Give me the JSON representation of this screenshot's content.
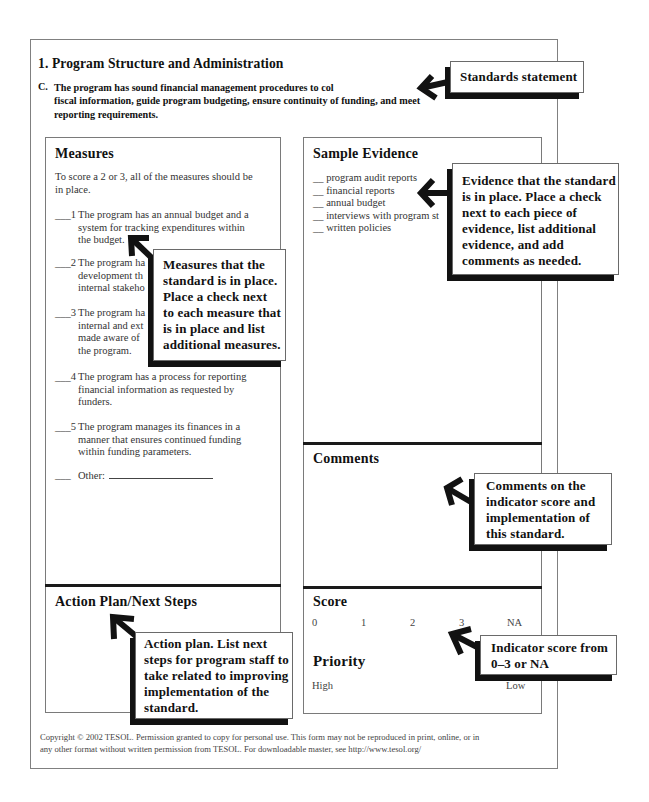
{
  "page": {
    "section_title": "1. Program Structure and Administration",
    "standard": {
      "letter": "C.",
      "lines": [
        "The program has sound financial management procedures to col",
        "fiscal information, guide program budgeting, ensure continuity of funding, and meet",
        "reporting requirements."
      ]
    }
  },
  "measures": {
    "heading": "Measures",
    "intro_lines": [
      "To score a 2 or 3, all of the measures should be",
      "in place."
    ],
    "items": [
      {
        "blank": "___",
        "number": "1",
        "lines": [
          "The program has an annual budget and a",
          "system for tracking expenditures within",
          "the budget."
        ]
      },
      {
        "blank": "___",
        "number": "2",
        "lines": [
          "The program ha",
          "development th",
          "internal stakeho"
        ]
      },
      {
        "blank": "___",
        "number": "3",
        "lines": [
          "The program ha",
          "internal and ext",
          "made aware of",
          "the program."
        ]
      },
      {
        "blank": "___",
        "number": "4",
        "lines": [
          "The program has a process for reporting",
          "financial information as requested by",
          "funders."
        ]
      },
      {
        "blank": "___",
        "number": "5",
        "lines": [
          "The program manages its finances in a",
          "manner that ensures continued funding",
          "within funding parameters."
        ]
      }
    ],
    "other": {
      "blank": "___",
      "label": "Other:"
    }
  },
  "evidence": {
    "heading": "Sample Evidence",
    "items": [
      {
        "blank": "__",
        "label": "program audit reports"
      },
      {
        "blank": "__",
        "label": "financial reports"
      },
      {
        "blank": "__",
        "label": "annual budget"
      },
      {
        "blank": "__",
        "label": "interviews with program st"
      },
      {
        "blank": "__",
        "label": "written policies"
      }
    ]
  },
  "comments": {
    "heading": "Comments"
  },
  "action_plan": {
    "heading": "Action Plan/Next Steps"
  },
  "score": {
    "heading": "Score",
    "options": [
      "0",
      "1",
      "2",
      "3",
      "NA"
    ]
  },
  "priority": {
    "heading": "Priority",
    "high": "High",
    "low": "Low"
  },
  "callouts": {
    "standards": {
      "lines": [
        "Standards statement"
      ]
    },
    "measures": {
      "lines": [
        "Measures that the",
        "standard is in place.",
        "Place a check next",
        "to each measure that",
        "is in place and list",
        "additional measures."
      ]
    },
    "evidence": {
      "lines": [
        "Evidence that the standard",
        "is in place. Place a check",
        "next to each piece of",
        "evidence, list additional",
        "evidence, and add",
        "comments as needed."
      ]
    },
    "comments": {
      "lines": [
        "Comments on the",
        "indicator score and",
        "implementation of",
        "this standard."
      ]
    },
    "score": {
      "lines": [
        "Indicator score from",
        "0–3 or NA"
      ]
    },
    "action_plan": {
      "lines": [
        "Action plan. List next",
        "steps for program staff to",
        "take related to improving",
        "implementation of the",
        "standard."
      ]
    }
  },
  "footer": {
    "copyright_lines": [
      "Copyright © 2002 TESOL. Permission granted to copy for personal use. This form may not be reproduced in print, online, or in",
      "any other format without written permission from TESOL. For downloadable master, see http://www.tesol.org/"
    ]
  }
}
